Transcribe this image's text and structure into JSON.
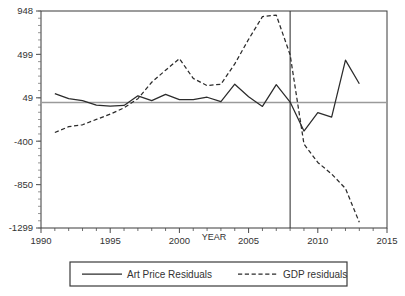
{
  "chart_data": {
    "type": "line",
    "title": "",
    "xlabel": "YEAR",
    "ylabel": "",
    "xlim": [
      1990,
      2015
    ],
    "ylim": [
      -1299,
      948
    ],
    "xticks": [
      "1990",
      "1995",
      "2000",
      "2005",
      "2010",
      "2015"
    ],
    "xtick_values": [
      1990,
      1995,
      2000,
      2005,
      2010,
      2015
    ],
    "yticks": [
      "948",
      "499",
      "49",
      "-400",
      "-850",
      "-1299"
    ],
    "ytick_values": [
      948,
      499,
      49,
      -400,
      -850,
      -1299
    ],
    "x_minor_tick_step": 1,
    "grid": false,
    "legend_position": "below-plot",
    "reference_lines": {
      "horizontal_zero_level": 0,
      "vertical_event_year": 2008
    },
    "series": [
      {
        "name": "Art Price Residuals",
        "style": "solid",
        "color": "#2b2b2b",
        "x": [
          1991,
          1992,
          1993,
          1994,
          1995,
          1996,
          1997,
          1998,
          1999,
          2000,
          2001,
          2002,
          2003,
          2004,
          2005,
          2006,
          2007,
          2008,
          2009,
          2010,
          2011,
          2012,
          2013
        ],
        "values": [
          92,
          40,
          20,
          -26,
          -38,
          -30,
          70,
          20,
          85,
          30,
          30,
          55,
          10,
          190,
          60,
          -40,
          185,
          5,
          -295,
          -105,
          -150,
          440,
          195
        ]
      },
      {
        "name": "GDP residuals",
        "style": "dashed",
        "color": "#2b2b2b",
        "x": [
          1991,
          1992,
          1993,
          1994,
          1995,
          1996,
          1997,
          1998,
          1999,
          2000,
          2001,
          2002,
          2003,
          2004,
          2005,
          2006,
          2007,
          2008,
          2009,
          2010,
          2011,
          2012,
          2013
        ],
        "values": [
          -310,
          -250,
          -230,
          -175,
          -120,
          -55,
          40,
          210,
          335,
          455,
          250,
          175,
          190,
          400,
          655,
          890,
          905,
          495,
          -430,
          -620,
          -740,
          -890,
          -1240
        ]
      }
    ]
  },
  "legend": {
    "entries": [
      {
        "label": "Art Price Residuals",
        "style": "solid"
      },
      {
        "label": "GDP residuals",
        "style": "dashed"
      }
    ]
  },
  "axis_labels": {
    "x_title": "YEAR"
  }
}
